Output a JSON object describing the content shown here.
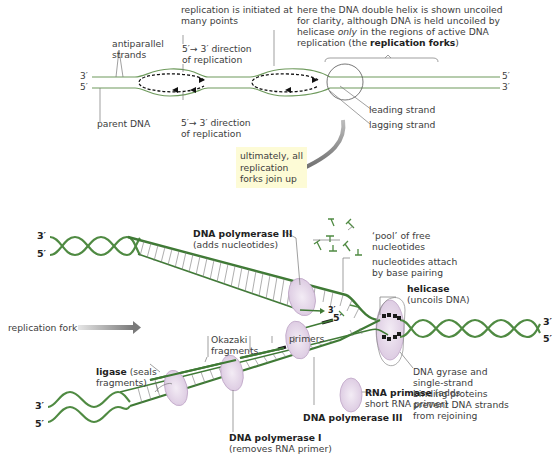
{
  "colors": {
    "strand_green": "#3f7a35",
    "light_green": "#6e9a5c",
    "enzyme_fill": "#e6d7ea",
    "enzyme_stroke": "#b79cc0",
    "note_bg": "#fdfbd6",
    "line_gray": "#7a7a7a"
  },
  "top_diagram": {
    "labels": {
      "initiated": [
        "replication is initiated at",
        "many points"
      ],
      "direction_top": [
        "5′→ 3′ direction",
        "of replication"
      ],
      "direction_bottom": [
        "5′→ 3′ direction",
        "of replication"
      ],
      "antiparallel": [
        "antiparallel",
        "strands"
      ],
      "parent_dna": "parent DNA",
      "helix_note_lines": [
        "here the DNA double helix is shown uncoiled",
        "for clarity, although DNA is held uncoiled by"
      ],
      "helix_note_line3_pre": "helicase ",
      "helix_note_line3_em": "only",
      "helix_note_line3_post": " in the regions of active DNA",
      "helix_note_line4_pre": "replication (the ",
      "helix_note_line4_bold": "replication forks",
      "helix_note_line4_post": ")",
      "leading_strand": "leading strand",
      "lagging_strand": "lagging strand"
    },
    "ends": {
      "left_top": "3′",
      "left_bottom": "5′",
      "right_top": "5′",
      "right_bottom": "3′"
    }
  },
  "note_box": {
    "lines": [
      "ultimately, all",
      "replication",
      "forks join up"
    ]
  },
  "bottom_diagram": {
    "ends": {
      "upper_left_top": "3′",
      "upper_left_bottom": "5′",
      "right_top": "3′",
      "right_bottom": "5′",
      "lower_left_top": "3′",
      "lower_left_bottom": "5′",
      "leading_3prime": "3′",
      "lagging_5prime": "5′"
    },
    "labels": {
      "pol3_top_bold": "DNA polymerase III",
      "pol3_top_sub": "(adds nucleotides)",
      "pool": [
        "‘pool’ of free",
        "nucleotides"
      ],
      "attach": [
        "nucleotides attach",
        "by base pairing"
      ],
      "helicase_bold": "helicase",
      "helicase_sub": "(uncoils DNA)",
      "replication_fork": "replication fork",
      "okazaki": [
        "Okazaki",
        "fragments"
      ],
      "primers": "primers",
      "ligase_bold": "ligase",
      "ligase_sub1": " (seals",
      "ligase_sub2": "fragments)",
      "gyrase": [
        "DNA gyrase and",
        "single-strand",
        "binding proteins",
        "prevent DNA strands",
        "from rejoining"
      ],
      "primase_bold": "RNA primase",
      "primase_sub1": " (adds",
      "primase_sub2": "short RNA primer)",
      "pol3_bottom_bold": "DNA polymerase III",
      "pol1_bold": "DNA polymerase I",
      "pol1_sub": "(removes RNA primer)"
    }
  }
}
